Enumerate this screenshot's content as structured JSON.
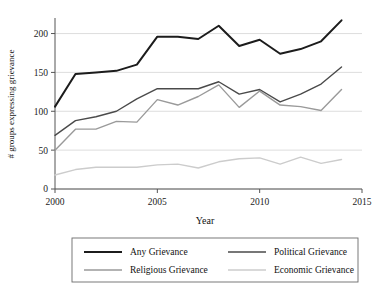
{
  "chart_data": {
    "type": "line",
    "title": "",
    "xlabel": "Year",
    "ylabel": "# groups expressing grievance",
    "xlim": [
      2000,
      2015
    ],
    "ylim": [
      0,
      220
    ],
    "xticks": [
      2000,
      2005,
      2010,
      2015
    ],
    "xtick_labels": [
      "2000",
      "2005",
      "2010",
      "2015"
    ],
    "yticks": [
      0,
      50,
      100,
      150,
      200
    ],
    "ytick_labels": [
      "0",
      "50",
      "100",
      "150",
      "200"
    ],
    "grid": true,
    "legend_position": "below-axes",
    "x": [
      2000,
      2001,
      2002,
      2003,
      2004,
      2005,
      2006,
      2007,
      2008,
      2009,
      2010,
      2011,
      2012,
      2013,
      2014
    ],
    "series": [
      {
        "name": "Any Grievance",
        "color": "#1c1c1c",
        "width": 2.0,
        "values": [
          106,
          148,
          150,
          152,
          160,
          196,
          196,
          193,
          210,
          184,
          192,
          174,
          180,
          190,
          217
        ]
      },
      {
        "name": "Political Grievance",
        "color": "#4a4a4a",
        "width": 1.4,
        "values": [
          69,
          88,
          93,
          100,
          116,
          129,
          129,
          129,
          138,
          122,
          128,
          112,
          122,
          135,
          157
        ]
      },
      {
        "name": "Religious Grievance",
        "color": "#9a9a9a",
        "width": 1.4,
        "values": [
          50,
          77,
          77,
          87,
          86,
          115,
          108,
          119,
          134,
          105,
          126,
          108,
          106,
          101,
          128
        ]
      },
      {
        "name": "Economic Grievance",
        "color": "#cccccc",
        "width": 1.4,
        "values": [
          18,
          25,
          28,
          28,
          28,
          31,
          32,
          27,
          35,
          39,
          40,
          32,
          41,
          33,
          38
        ]
      }
    ]
  },
  "legend": {
    "entries": [
      {
        "label": "Any Grievance"
      },
      {
        "label": "Political Grievance"
      },
      {
        "label": "Religious Grievance"
      },
      {
        "label": "Economic Grievance"
      }
    ]
  }
}
